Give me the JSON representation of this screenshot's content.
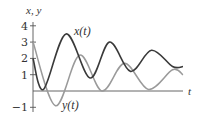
{
  "chart_data": {
    "type": "line",
    "title": "",
    "ylabel": "x, y",
    "xlabel": "t",
    "ylim": [
      -1,
      4
    ],
    "yticks": [
      -1,
      1,
      2,
      3,
      4
    ],
    "ytick_labels": [
      "−1",
      "1",
      "2",
      "3",
      "4"
    ],
    "grid": false,
    "legend": "inline labels",
    "series": [
      {
        "name": "x(t)",
        "label": "x(t)",
        "color": "#3a3a3a",
        "t": [
          0,
          0.07,
          0.22,
          0.38,
          0.51,
          0.65,
          0.79,
          0.93,
          1.0
        ],
        "values": [
          2.0,
          0.1,
          3.5,
          0.8,
          3.0,
          1.2,
          2.5,
          1.5,
          1.5
        ]
      },
      {
        "name": "y(t)",
        "label": "y(t)",
        "color": "#9a9a9a",
        "t": [
          0,
          0.15,
          0.31,
          0.46,
          0.61,
          0.77,
          0.93,
          1.0
        ],
        "values": [
          3.0,
          -0.9,
          2.2,
          0.0,
          1.7,
          0.1,
          1.3,
          1.0
        ]
      }
    ]
  }
}
